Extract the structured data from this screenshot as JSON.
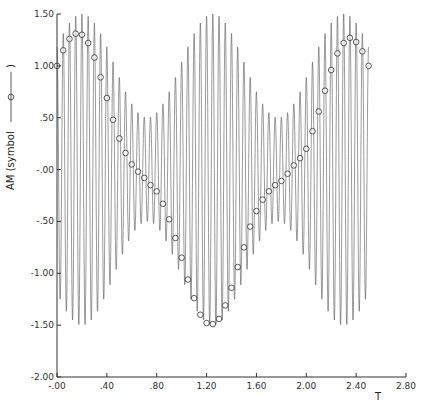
{
  "chart_data": {
    "type": "line",
    "title": "",
    "xlabel": "T",
    "ylabel": "AM  (symbol",
    "ylabel_symbol": "circle",
    "xlim": [
      0,
      2.8
    ],
    "ylim": [
      -2.0,
      1.5
    ],
    "grid": false,
    "x_ticks": [
      0,
      0.4,
      0.8,
      1.2,
      1.6,
      2.0,
      2.4,
      2.8
    ],
    "x_tick_labels": [
      "-.00",
      ".40",
      ".80",
      "1.20",
      "1.60",
      "2.00",
      "2.40",
      "2.80"
    ],
    "y_ticks": [
      1.5,
      1.0,
      0.5,
      0.0,
      -0.5,
      -1.0,
      -1.5,
      -2.0
    ],
    "y_tick_labels": [
      "1.50",
      "1.00",
      ".50",
      "-.00",
      "-.50",
      "-1.00",
      "-1.50",
      "-2.00"
    ],
    "series": [
      {
        "name": "AM waveform",
        "style": "line",
        "color": "#555555",
        "description": "amplitude-modulated carrier",
        "t_range": [
          0,
          2.5
        ],
        "carrier_frequency": 20,
        "envelope_mean": 1.0,
        "envelope_modulation_depth": 0.5,
        "envelope_period": 1.05,
        "envelope_peak_t": 0.2
      },
      {
        "name": "AM (symbol)",
        "style": "markers",
        "marker": "circle",
        "color": "#333333",
        "x": [
          0.0,
          0.05,
          0.1,
          0.15,
          0.2,
          0.25,
          0.3,
          0.35,
          0.4,
          0.45,
          0.5,
          0.55,
          0.6,
          0.65,
          0.7,
          0.75,
          0.8,
          0.85,
          0.9,
          0.95,
          1.0,
          1.05,
          1.1,
          1.15,
          1.2,
          1.25,
          1.3,
          1.35,
          1.4,
          1.45,
          1.5,
          1.55,
          1.6,
          1.65,
          1.7,
          1.75,
          1.8,
          1.85,
          1.9,
          1.95,
          2.0,
          2.05,
          2.1,
          2.15,
          2.2,
          2.25,
          2.3,
          2.35,
          2.4,
          2.45,
          2.5
        ],
        "y": [
          1.0,
          1.15,
          1.26,
          1.31,
          1.3,
          1.22,
          1.08,
          0.89,
          0.69,
          0.48,
          0.3,
          0.16,
          0.05,
          -0.02,
          -0.08,
          -0.15,
          -0.21,
          -0.33,
          -0.48,
          -0.66,
          -0.85,
          -1.06,
          -1.24,
          -1.4,
          -1.48,
          -1.49,
          -1.44,
          -1.31,
          -1.14,
          -0.94,
          -0.75,
          -0.55,
          -0.4,
          -0.29,
          -0.21,
          -0.15,
          -0.11,
          -0.04,
          0.04,
          0.11,
          0.2,
          0.37,
          0.56,
          0.76,
          0.96,
          1.12,
          1.22,
          1.27,
          1.23,
          1.14,
          1.0
        ]
      }
    ]
  }
}
